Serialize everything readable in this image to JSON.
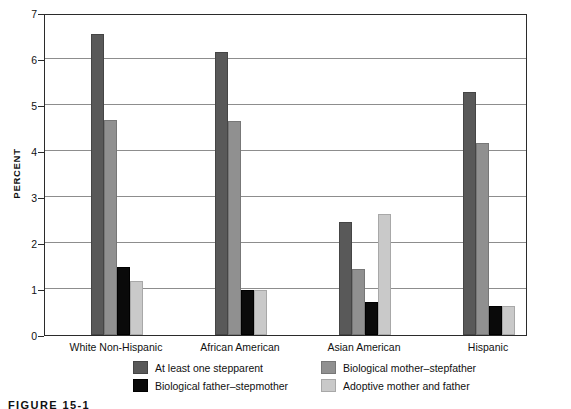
{
  "chart_data": {
    "type": "bar",
    "title": "",
    "xlabel": "",
    "ylabel": "PERCENT",
    "ylim": [
      0,
      7
    ],
    "yticks": [
      0,
      1,
      2,
      3,
      4,
      5,
      6,
      7
    ],
    "grid": true,
    "legend_position": "bottom",
    "categories": [
      "White Non-Hispanic",
      "African American",
      "Asian American",
      "Hispanic"
    ],
    "series": [
      {
        "name": "At least one stepparent",
        "color": "#595959",
        "values": [
          6.55,
          6.15,
          2.45,
          5.28
        ]
      },
      {
        "name": "Biological mother–stepfather",
        "color": "#909090",
        "values": [
          4.68,
          4.65,
          1.43,
          4.18
        ]
      },
      {
        "name": "Biological father–stepmother",
        "color": "#0a0a0a",
        "values": [
          1.48,
          0.98,
          0.72,
          0.62
        ]
      },
      {
        "name": "Adoptive mother and father",
        "color": "#c9c9c9",
        "values": [
          1.18,
          0.98,
          2.63,
          0.62
        ]
      }
    ]
  },
  "axis": {
    "y_label": "PERCENT",
    "y_tick_labels": [
      "0",
      "1",
      "2",
      "3",
      "4",
      "5",
      "6",
      "7"
    ]
  },
  "legend": {
    "items": [
      {
        "label": "At least one stepparent",
        "swatch": "dark-gray-swatch"
      },
      {
        "label": "Biological mother–stepfather",
        "swatch": "medium-gray-swatch"
      },
      {
        "label": "Biological father–stepmother",
        "swatch": "black-swatch"
      },
      {
        "label": "Adoptive mother and father",
        "swatch": "light-gray-swatch"
      }
    ]
  },
  "caption": {
    "text": "FIGURE 15-1"
  }
}
